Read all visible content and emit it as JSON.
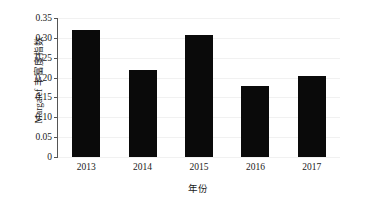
{
  "chart_data": {
    "type": "bar",
    "title": "",
    "categories": [
      "2013",
      "2014",
      "2015",
      "2016",
      "2017"
    ],
    "values": [
      0.319,
      0.22,
      0.307,
      0.178,
      0.204
    ],
    "series": [
      {
        "name": "Margalef 丰富度指数",
        "values": [
          0.319,
          0.22,
          0.307,
          0.178,
          0.204
        ]
      }
    ],
    "xlabel": "年份",
    "ylabel": "Margalef 丰富度指数",
    "ylim": [
      0,
      0.35
    ],
    "yticks": [
      0,
      0.05,
      0.1,
      0.15,
      0.2,
      0.25,
      0.3,
      0.35
    ],
    "ytick_labels": [
      "0",
      "0.05",
      "0.10",
      "0.15",
      "0.20",
      "0.25",
      "0.30",
      "0.35"
    ],
    "grid": false,
    "legend": "none",
    "bar_color": "#0a0a0a",
    "axis_color": "#555555"
  }
}
